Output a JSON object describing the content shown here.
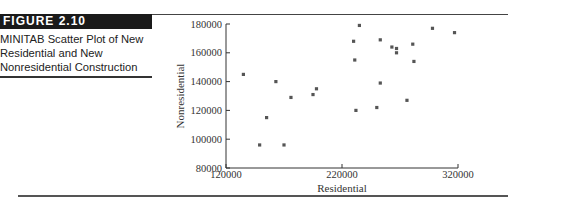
{
  "figure": {
    "label": "FIGURE 2.10",
    "caption_lines": [
      "MINITAB Scatter Plot of New",
      "Residential and New",
      "Nonresidential Construction"
    ]
  },
  "colors": {
    "marker": "#555555",
    "axis": "#333333",
    "label_bg": "#1a1a1a"
  },
  "chart_data": {
    "type": "scatter",
    "title": "MINITAB Scatter Plot of New Residential and New Nonresidential Construction",
    "xlabel": "Residential",
    "ylabel": "Nonresidential",
    "xlim": [
      120000,
      320000
    ],
    "ylim": [
      80000,
      180000
    ],
    "xticks": [
      120000,
      220000,
      320000
    ],
    "yticks": [
      80000,
      100000,
      120000,
      140000,
      160000,
      180000
    ],
    "xtick_labels": [
      "120000",
      "220000",
      "320000"
    ],
    "ytick_labels": [
      "80000",
      "100000",
      "120000",
      "140000",
      "160000",
      "180000"
    ],
    "grid": false,
    "legend": null,
    "marker": "square",
    "points": [
      {
        "x": 135000,
        "y": 145000
      },
      {
        "x": 163000,
        "y": 140000
      },
      {
        "x": 176000,
        "y": 129000
      },
      {
        "x": 195000,
        "y": 131000
      },
      {
        "x": 198000,
        "y": 135000
      },
      {
        "x": 155000,
        "y": 115000
      },
      {
        "x": 149000,
        "y": 96000
      },
      {
        "x": 170000,
        "y": 96000
      },
      {
        "x": 235000,
        "y": 179000
      },
      {
        "x": 230000,
        "y": 168000
      },
      {
        "x": 253000,
        "y": 169000
      },
      {
        "x": 263000,
        "y": 164000
      },
      {
        "x": 267000,
        "y": 163000
      },
      {
        "x": 267000,
        "y": 160000
      },
      {
        "x": 281000,
        "y": 166000
      },
      {
        "x": 231000,
        "y": 155000
      },
      {
        "x": 282000,
        "y": 154000
      },
      {
        "x": 253000,
        "y": 139000
      },
      {
        "x": 276000,
        "y": 127000
      },
      {
        "x": 250000,
        "y": 122000
      },
      {
        "x": 232000,
        "y": 120000
      },
      {
        "x": 298000,
        "y": 177000
      },
      {
        "x": 317000,
        "y": 174000
      }
    ]
  }
}
